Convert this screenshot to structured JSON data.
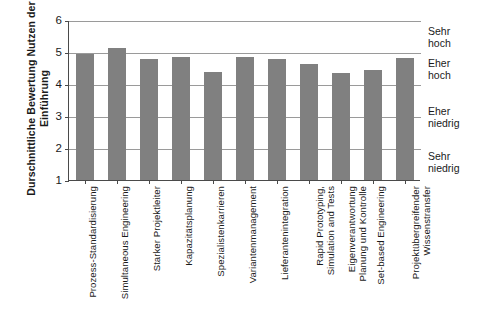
{
  "chart_data": {
    "type": "bar",
    "title": "",
    "xlabel": "",
    "ylabel": "Durschnittliche Bewertung Nutzen der\nEinführung",
    "ylim": [
      1,
      6
    ],
    "ytick_labels": [
      "1",
      "2",
      "3",
      "4",
      "5",
      "6"
    ],
    "ytick_values": [
      1,
      2,
      3,
      4,
      5,
      6
    ],
    "grid": true,
    "legend": "none",
    "bar_color": "#808080",
    "categories": [
      "Prozess-Standardisierung",
      "Simultaneous Engineering",
      "Starker Projektleiter",
      "Kapazitätsplanung",
      "Spezialistenkarrieren",
      "Variantenmanagement",
      "Lieferantenintegration",
      "Rapid Prototyping,\nSimulation and Tests",
      "Eigenverantwortung\nPlanung und Kontrolle",
      "Set-based Engineering",
      "Projektübergreifender\nWissenstransfer"
    ],
    "values": [
      4.95,
      5.12,
      4.78,
      4.83,
      4.38,
      4.85,
      4.79,
      4.63,
      4.35,
      4.43,
      4.8
    ],
    "right_scale_labels": [
      {
        "text": "Sehr\nhoch",
        "at": 5.5
      },
      {
        "text": "Eher\nhoch",
        "at": 4.5
      },
      {
        "text": "Eher\nniedrig",
        "at": 3.0
      },
      {
        "text": "Sehr\nniedrig",
        "at": 1.6
      }
    ]
  }
}
